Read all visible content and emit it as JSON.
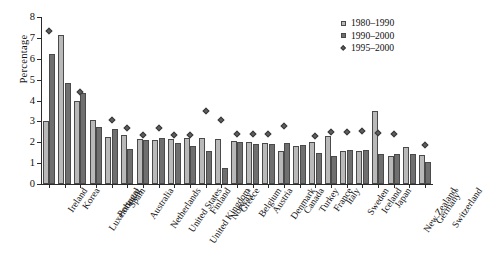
{
  "chart_data": {
    "type": "bar",
    "title": "",
    "subtitle": "",
    "xlabel": "",
    "ylabel": "Percentage",
    "ylim": [
      0,
      8
    ],
    "yticks": [
      0,
      1,
      2,
      3,
      4,
      5,
      6,
      7,
      8
    ],
    "grid": false,
    "legend_position": "top-right",
    "categories": [
      "Ireland",
      "Korea",
      "Luxembourg",
      "Portugal",
      "Spain",
      "Australia",
      "Netherlands",
      "United States",
      "United Kingdom",
      "Finland",
      "Norway",
      "Greece",
      "Belgium",
      "Austria",
      "Denmark",
      "Canada",
      "Turkey",
      "France",
      "Italy",
      "Sweden",
      "Iceland",
      "Japan",
      "New Zealand",
      "Germany",
      "Switzerland"
    ],
    "category_footnotes": {
      "Norway": "a",
      "Germany": "b"
    },
    "series": [
      {
        "name": "1980–1990",
        "type": "bar",
        "color": "#b9b9b9",
        "values": [
          3.0,
          7.15,
          4.0,
          3.05,
          2.25,
          2.35,
          2.15,
          2.1,
          2.15,
          2.2,
          2.2,
          2.15,
          2.05,
          2.0,
          1.95,
          1.6,
          1.8,
          2.0,
          2.3,
          1.6,
          1.6,
          3.5,
          1.35,
          1.75,
          1.4
        ],
        "labels_shown": false
      },
      {
        "name": "1990–2000",
        "type": "bar",
        "color": "#6f6f6f",
        "values": [
          6.25,
          4.85,
          4.35,
          2.75,
          2.65,
          1.7,
          2.1,
          2.2,
          1.95,
          1.8,
          1.6,
          0.75,
          2.0,
          1.9,
          1.9,
          1.95,
          1.85,
          1.5,
          1.35,
          1.65,
          1.65,
          1.45,
          1.45,
          1.45,
          1.05
        ],
        "labels_shown": false
      },
      {
        "name": "1995–2000",
        "type": "scatter",
        "marker": "diamond",
        "color": "#5e5e5e",
        "values": [
          7.35,
          null,
          4.4,
          null,
          3.05,
          2.7,
          2.35,
          2.7,
          2.35,
          2.35,
          3.5,
          3.05,
          2.4,
          2.4,
          2.4,
          2.8,
          null,
          2.3,
          2.5,
          2.5,
          2.55,
          2.45,
          2.4,
          null,
          1.85
        ],
        "labels_shown": false
      }
    ]
  },
  "legend": {
    "entries": [
      {
        "key": "square-light",
        "label": "1980–1990"
      },
      {
        "key": "square-dark",
        "label": "1990–2000"
      },
      {
        "key": "diamond",
        "label": "1995–2000"
      }
    ]
  },
  "axes": {
    "y_title": "Percentage",
    "y_tick_labels": [
      "0",
      "1",
      "2",
      "3",
      "4",
      "5",
      "6",
      "7",
      "8"
    ]
  },
  "colors": {
    "series1": "#b9b9b9",
    "series2": "#6f6f6f",
    "marker": "#5e5e5e",
    "axis": "#2a2a2a",
    "background": "#ffffff"
  }
}
